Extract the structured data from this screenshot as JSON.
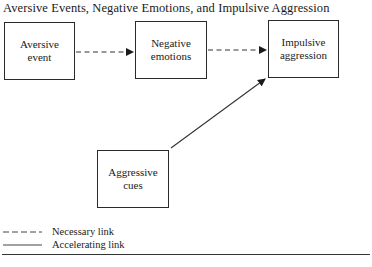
{
  "diagram": {
    "title": "Aversive Events, Negative Emotions, and Impulsive Aggression",
    "nodes": [
      {
        "id": "aversive-event",
        "line1": "Aversive",
        "line2": "event"
      },
      {
        "id": "negative-emotions",
        "line1": "Negative",
        "line2": "emotions"
      },
      {
        "id": "impulsive-aggression",
        "line1": "Impulsive",
        "line2": "aggression"
      },
      {
        "id": "aggressive-cues",
        "line1": "Aggressive",
        "line2": "cues"
      }
    ],
    "edges": [
      {
        "from": "aversive-event",
        "to": "negative-emotions",
        "style": "dashed",
        "type": "Necessary link"
      },
      {
        "from": "negative-emotions",
        "to": "impulsive-aggression",
        "style": "dashed",
        "type": "Necessary link"
      },
      {
        "from": "aggressive-cues",
        "to": "impulsive-aggression",
        "style": "solid",
        "type": "Accelerating link"
      }
    ],
    "legend": {
      "dashed_label": "Necessary link",
      "solid_label": "Accelerating link"
    },
    "colors": {
      "stroke": "#2a2a2a",
      "background": "#ffffff"
    }
  }
}
